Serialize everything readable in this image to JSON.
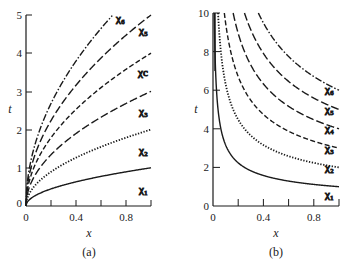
{
  "chart_data": [
    {
      "panel": "(a)",
      "type": "line",
      "title": "",
      "xlabel": "x",
      "ylabel": "t",
      "xlim": [
        0,
        1.0
      ],
      "ylim": [
        0,
        5
      ],
      "xticks": [
        0,
        0.2,
        0.4,
        0.6,
        0.8,
        1.0
      ],
      "xtick_labels": [
        "0",
        "0.4",
        "0.8"
      ],
      "yticks": [
        0,
        1,
        2,
        3,
        4,
        5
      ],
      "ytick_labels": [
        "0",
        "1",
        "2",
        "3",
        "4",
        "5"
      ],
      "grid": false,
      "legend": "inline labels at right end of curves",
      "x": [
        0,
        0.02,
        0.05,
        0.1,
        0.2,
        0.3,
        0.4,
        0.5,
        0.6,
        0.7,
        0.8,
        0.9,
        1.0
      ],
      "series": [
        {
          "name": "χ1",
          "style": "solid",
          "values": [
            0,
            0.14,
            0.22,
            0.32,
            0.45,
            0.55,
            0.63,
            0.71,
            0.77,
            0.84,
            0.89,
            0.95,
            1.0
          ]
        },
        {
          "name": "χ2",
          "style": "dotted",
          "values": [
            0,
            0.28,
            0.45,
            0.63,
            0.89,
            1.1,
            1.26,
            1.41,
            1.55,
            1.67,
            1.79,
            1.9,
            2.0
          ]
        },
        {
          "name": "χ3",
          "style": "dash-long",
          "values": [
            0,
            0.42,
            0.67,
            0.95,
            1.34,
            1.64,
            1.9,
            2.12,
            2.32,
            2.51,
            2.68,
            2.85,
            3.0
          ]
        },
        {
          "name": "χc",
          "style": "dashed",
          "values": [
            0,
            0.57,
            0.89,
            1.26,
            1.79,
            2.19,
            2.53,
            2.83,
            3.1,
            3.35,
            3.58,
            3.79,
            4.0
          ]
        },
        {
          "name": "χ5",
          "style": "dash-long",
          "values": [
            0,
            0.71,
            1.12,
            1.58,
            2.24,
            2.74,
            3.16,
            3.54,
            3.87,
            4.18,
            4.47,
            4.74,
            5.0
          ]
        },
        {
          "name": "χ6",
          "style": "dash-dot",
          "values": [
            0,
            0.85,
            1.34,
            1.9,
            2.68,
            3.29,
            3.79,
            4.24,
            4.65,
            5.0,
            null,
            null,
            null
          ]
        }
      ],
      "annotations": [
        "(a)"
      ]
    },
    {
      "panel": "(b)",
      "type": "line",
      "title": "",
      "xlabel": "x",
      "ylabel": "t",
      "xlim": [
        0,
        1.0
      ],
      "ylim": [
        0,
        10
      ],
      "xticks": [
        0,
        0.2,
        0.4,
        0.6,
        0.8,
        1.0
      ],
      "xtick_labels": [
        "0",
        "0.4",
        "0.8"
      ],
      "yticks": [
        0,
        2,
        4,
        6,
        8,
        10
      ],
      "ytick_labels": [
        "0",
        "2",
        "4",
        "6",
        "8",
        "10"
      ],
      "grid": false,
      "legend": "inline labels at right end of curves",
      "x": [
        0.01,
        0.02,
        0.05,
        0.1,
        0.2,
        0.3,
        0.4,
        0.5,
        0.6,
        0.7,
        0.8,
        0.9,
        1.0
      ],
      "series": [
        {
          "name": "χ1",
          "style": "solid",
          "values": [
            10.0,
            7.07,
            4.47,
            3.16,
            2.24,
            1.83,
            1.58,
            1.41,
            1.29,
            1.2,
            1.12,
            1.05,
            1.0
          ]
        },
        {
          "name": "χ2",
          "style": "dotted",
          "values": [
            null,
            null,
            8.94,
            6.32,
            4.47,
            3.65,
            3.16,
            2.83,
            2.58,
            2.39,
            2.24,
            2.11,
            2.0
          ]
        },
        {
          "name": "χ3",
          "style": "dashed",
          "values": [
            null,
            null,
            null,
            9.49,
            6.71,
            5.48,
            4.74,
            4.24,
            3.87,
            3.59,
            3.35,
            3.16,
            3.0
          ]
        },
        {
          "name": "χ4",
          "style": "dash-long",
          "values": [
            null,
            null,
            null,
            null,
            8.94,
            7.3,
            6.32,
            5.66,
            5.16,
            4.78,
            4.47,
            4.22,
            4.0
          ]
        },
        {
          "name": "χ5",
          "style": "dash-long",
          "values": [
            null,
            null,
            null,
            null,
            null,
            9.13,
            7.91,
            7.07,
            6.45,
            5.98,
            5.59,
            5.27,
            5.0
          ]
        },
        {
          "name": "χ6",
          "style": "dash-dot",
          "values": [
            null,
            null,
            null,
            null,
            null,
            null,
            9.49,
            8.49,
            7.75,
            7.17,
            6.71,
            6.32,
            6.0
          ]
        }
      ],
      "annotations": [
        "(b)"
      ]
    }
  ],
  "panels": {
    "a": {
      "caption": "(a)",
      "xlabel": "x",
      "ylabel": "t",
      "xtick_labels": [
        "0",
        "0.4",
        "0.8"
      ],
      "ytick_labels": [
        "0",
        "1",
        "2",
        "3",
        "4",
        "5"
      ],
      "series_labels": [
        "χ₁",
        "χ₂",
        "χ₃",
        "χc",
        "χ₅",
        "χ₆"
      ]
    },
    "b": {
      "caption": "(b)",
      "xlabel": "x",
      "ylabel": "t",
      "xtick_labels": [
        "0",
        "0.4",
        "0.8"
      ],
      "ytick_labels": [
        "0",
        "2",
        "4",
        "6",
        "8",
        "10"
      ],
      "series_labels": [
        "χ₁",
        "χ₂",
        "χ₃",
        "χ₄",
        "χ₅",
        "χ₆"
      ]
    }
  }
}
